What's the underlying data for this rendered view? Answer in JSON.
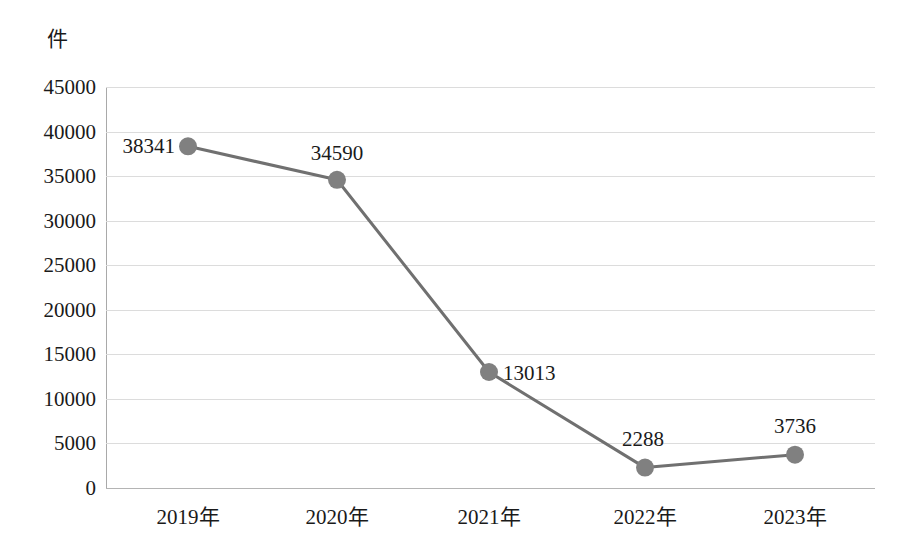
{
  "chart_data": {
    "type": "line",
    "title": "",
    "xlabel": "",
    "ylabel": "件",
    "categories": [
      "2019年",
      "2020年",
      "2021年",
      "2022年",
      "2023年"
    ],
    "values": [
      38341,
      34590,
      13013,
      2288,
      3736
    ],
    "series": [
      {
        "name": "件数",
        "values": [
          38341,
          34590,
          13013,
          2288,
          3736
        ]
      }
    ],
    "point_labels": [
      "38341",
      "34590",
      "13013",
      "2288",
      "3736"
    ],
    "ylim": [
      0,
      45000
    ],
    "ytick_step": 5000,
    "yticks": [
      "45000",
      "40000",
      "35000",
      "30000",
      "25000",
      "20000",
      "15000",
      "10000",
      "5000",
      "0"
    ],
    "grid": true,
    "legend": "none",
    "marker": "circle",
    "colors": {
      "marker": "#808080",
      "line": "#707070",
      "gridline": "#dcdcdc",
      "axis": "#a9a9a9",
      "text": "#1a1a1a",
      "background": "#ffffff"
    }
  },
  "axis": {
    "unit_label": "件"
  },
  "title_remnant": ""
}
